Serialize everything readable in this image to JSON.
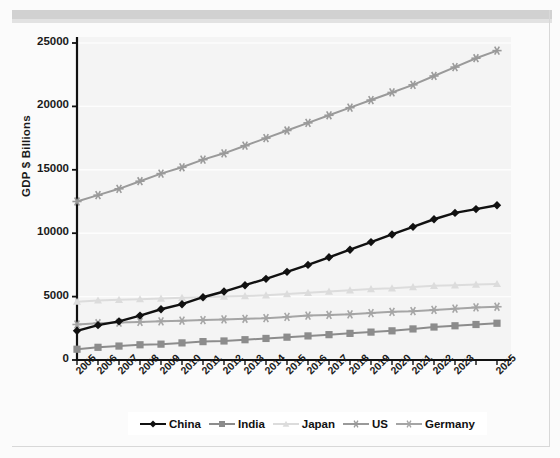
{
  "chart_data": {
    "type": "line",
    "title": "",
    "xlabel": "",
    "ylabel": "GDP $ Billions",
    "ylim": [
      0,
      25000
    ],
    "yticks": [
      0,
      5000,
      10000,
      15000,
      20000,
      25000
    ],
    "ytick_labels": [
      "0",
      "5000",
      "10000",
      "15000",
      "20000",
      "25000"
    ],
    "grid": true,
    "legend_position": "bottom",
    "categories": [
      "2005",
      "2006",
      "2007",
      "2008",
      "2009",
      "2010",
      "2011",
      "2012",
      "2013",
      "2014",
      "2015",
      "2016",
      "2017",
      "2018",
      "2019",
      "2020",
      "2021",
      "2022",
      "2023",
      "2024",
      "2025"
    ],
    "xtick_labels": [
      "2005",
      "2006",
      "2007",
      "2008",
      "2009",
      "2010",
      "2011",
      "2012",
      "2013",
      "2014",
      "2015",
      "2016",
      "2017",
      "2018",
      "2019",
      "2020",
      "2021",
      "2022",
      "2023",
      "",
      "2025"
    ],
    "series": [
      {
        "name": "China",
        "color": "#111111",
        "marker": "diamond",
        "values": [
          2300,
          2750,
          3050,
          3500,
          4000,
          4400,
          4950,
          5400,
          5900,
          6400,
          6950,
          7500,
          8100,
          8700,
          9300,
          9900,
          10500,
          11100,
          11600,
          11900,
          12200
        ]
      },
      {
        "name": "India",
        "color": "#8c8c8c",
        "marker": "square",
        "values": [
          850,
          1000,
          1100,
          1200,
          1250,
          1350,
          1450,
          1500,
          1600,
          1700,
          1800,
          1900,
          2000,
          2100,
          2200,
          2300,
          2450,
          2600,
          2700,
          2800,
          2900
        ]
      },
      {
        "name": "Japan",
        "color": "#dcdcdc",
        "marker": "triangle",
        "values": [
          4600,
          4700,
          4750,
          4800,
          4850,
          4900,
          4950,
          5000,
          5050,
          5100,
          5200,
          5300,
          5400,
          5500,
          5600,
          5650,
          5750,
          5850,
          5900,
          5950,
          6000
        ]
      },
      {
        "name": "US",
        "color": "#9a9a9a",
        "marker": "star",
        "values": [
          12500,
          13000,
          13500,
          14100,
          14700,
          15200,
          15800,
          16300,
          16900,
          17500,
          18100,
          18700,
          19300,
          19900,
          20500,
          21100,
          21700,
          22400,
          23100,
          23800,
          24400
        ]
      },
      {
        "name": "Germany",
        "color": "#a5a5a5",
        "marker": "star",
        "values": [
          2800,
          2900,
          2950,
          3000,
          3050,
          3100,
          3150,
          3200,
          3250,
          3300,
          3400,
          3500,
          3550,
          3600,
          3700,
          3800,
          3850,
          3950,
          4050,
          4150,
          4200
        ]
      }
    ]
  },
  "artifacts": {
    "bleed_title": ""
  }
}
